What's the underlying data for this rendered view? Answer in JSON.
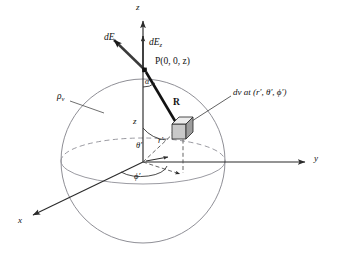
{
  "figure": {
    "type": "physics-vector-diagram",
    "colors": {
      "sphere_outline": "#8a8a92",
      "equator": "#8a8a92",
      "axis": "#2b2b2b",
      "vector_R": "#121212",
      "vector_dE": "#3a3a3a",
      "dashed": "#4a4a4a",
      "cube_fill": "#cfcfcf",
      "cube_top": "#e6e6e6",
      "cube_side": "#9f9f9f",
      "text": "#111111",
      "background": "#ffffff"
    },
    "axes": {
      "z": "z",
      "y": "y",
      "x": "x"
    },
    "labels": {
      "dE": "dE",
      "dEz_main": "dE",
      "dEz_sub": "z",
      "point_P": "P(0, 0, z)",
      "alpha": "α",
      "R": "R",
      "z_height": "z",
      "rho_main": "ρ",
      "rho_sub": "v",
      "dv": "dv at (r′, θ′, ϕ′)",
      "r_prime": "r′",
      "theta_prime": "θ′",
      "phi_prime": "ϕ′"
    },
    "geometry": {
      "origin": [
        143,
        162
      ],
      "sphere_center": [
        143,
        161
      ],
      "sphere_rx": 82,
      "sphere_ry": 82,
      "equator_rx": 82,
      "equator_ry": 23,
      "point_P": [
        145,
        69
      ],
      "cube_center": [
        181,
        128
      ],
      "z_axis_tip": [
        143,
        16
      ],
      "y_axis_tip": [
        311,
        162
      ],
      "x_axis_tip": [
        26,
        218
      ]
    }
  }
}
